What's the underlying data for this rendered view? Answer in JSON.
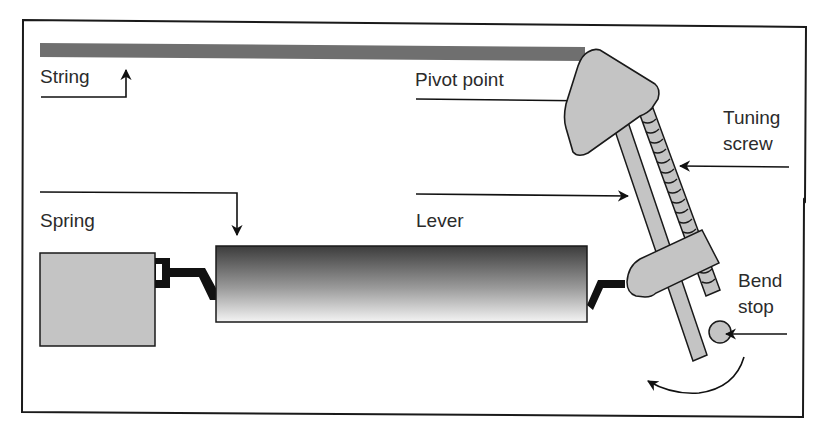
{
  "diagram": {
    "type": "mechanical-schematic",
    "colors": {
      "frame": "#1a1a1a",
      "string": "#6f6f6f",
      "part_fill": "#c4c4c4",
      "lever_gradient_top": "#3c3c3c",
      "lever_gradient_bottom": "#f4f4f4",
      "arrow": "#111111",
      "text": "#2b2b2b"
    },
    "labels": {
      "string": "String",
      "pivot_point": "Pivot point",
      "tuning_screw_line1": "Tuning",
      "tuning_screw_line2": "screw",
      "spring": "Spring",
      "lever": "Lever",
      "bend_stop_line1": "Bend",
      "bend_stop_line2": "stop"
    },
    "components": [
      {
        "id": "string",
        "label": "String"
      },
      {
        "id": "pivot-point",
        "label": "Pivot point"
      },
      {
        "id": "tuning-screw",
        "label": "Tuning screw"
      },
      {
        "id": "spring",
        "label": "Spring"
      },
      {
        "id": "lever",
        "label": "Lever"
      },
      {
        "id": "bend-stop",
        "label": "Bend stop"
      }
    ]
  }
}
